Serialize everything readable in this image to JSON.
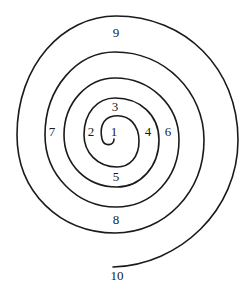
{
  "diagram": {
    "type": "spiral",
    "stroke_color": "#1a1a1a",
    "background_color": "#ffffff",
    "labels": [
      {
        "text": "1",
        "x": 114,
        "y": 133
      },
      {
        "text": "2",
        "x": 91,
        "y": 133
      },
      {
        "text": "3",
        "x": 115,
        "y": 108
      },
      {
        "text": "4",
        "x": 148,
        "y": 133
      },
      {
        "text": "5",
        "x": 116,
        "y": 178
      },
      {
        "text": "6",
        "x": 168,
        "y": 133
      },
      {
        "text": "7",
        "x": 52,
        "y": 133
      },
      {
        "text": "8",
        "x": 116,
        "y": 221
      },
      {
        "text": "9",
        "x": 116,
        "y": 34
      },
      {
        "text": "10",
        "x": 117,
        "y": 277
      }
    ]
  }
}
